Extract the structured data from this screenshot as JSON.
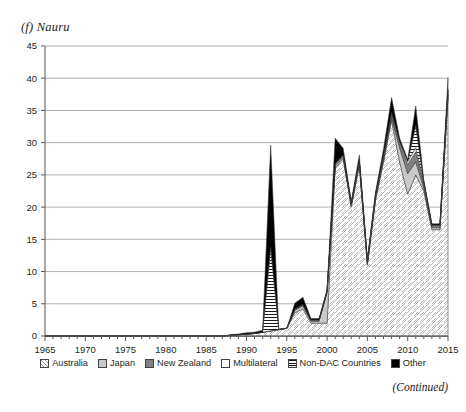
{
  "figure": {
    "panel_title": "(f) Nauru",
    "continued_note": "(Continued)"
  },
  "legend": {
    "position": "bottom",
    "items": [
      {
        "label": "Australia",
        "pattern": "diagonal-hatch",
        "color": "#ffffff",
        "icon": "legend-swatch-australia"
      },
      {
        "label": "Japan",
        "pattern": "solid-light-gray",
        "color": "#c9c9c9",
        "icon": "legend-swatch-japan"
      },
      {
        "label": "New Zealand",
        "pattern": "solid-dark-gray",
        "color": "#808080",
        "icon": "legend-swatch-new-zealand"
      },
      {
        "label": "Multilateral",
        "pattern": "white",
        "color": "#ffffff",
        "icon": "legend-swatch-multilateral"
      },
      {
        "label": "Non-DAC Countries",
        "pattern": "horizontal-lines",
        "color": "#ffffff",
        "icon": "legend-swatch-non-dac-countries"
      },
      {
        "label": "Other",
        "pattern": "solid-black",
        "color": "#000000",
        "icon": "legend-swatch-other"
      }
    ]
  },
  "axes": {
    "y_ticks": [
      "0",
      "5",
      "10",
      "15",
      "20",
      "25",
      "30",
      "35",
      "40",
      "45"
    ],
    "x_ticks": [
      "1965",
      "1970",
      "1975",
      "1980",
      "1985",
      "1990",
      "1995",
      "2000",
      "2005",
      "2010",
      "2015"
    ]
  },
  "chart_data": {
    "type": "area",
    "stacked": true,
    "title": "(f) Nauru",
    "xlabel": "",
    "ylabel": "",
    "xlim": [
      1965,
      2015
    ],
    "ylim": [
      0,
      45
    ],
    "ytick_step": 5,
    "xtick_step": 5,
    "grid": "horizontal",
    "legend_position": "bottom",
    "x": [
      1965,
      1966,
      1967,
      1968,
      1969,
      1970,
      1971,
      1972,
      1973,
      1974,
      1975,
      1976,
      1977,
      1978,
      1979,
      1980,
      1981,
      1982,
      1983,
      1984,
      1985,
      1986,
      1987,
      1988,
      1989,
      1990,
      1991,
      1992,
      1993,
      1994,
      1995,
      1996,
      1997,
      1998,
      1999,
      2000,
      2001,
      2002,
      2003,
      2004,
      2005,
      2006,
      2007,
      2008,
      2009,
      2010,
      2011,
      2012,
      2013,
      2014,
      2015
    ],
    "series": [
      {
        "name": "Australia",
        "values": [
          0,
          0,
          0,
          0,
          0,
          0,
          0,
          0,
          0,
          0,
          0,
          0,
          0,
          0,
          0,
          0,
          0,
          0,
          0,
          0,
          0,
          0,
          0,
          0.1,
          0.2,
          0.3,
          0.4,
          0.6,
          0.8,
          1.0,
          1.2,
          3.6,
          4.2,
          2.0,
          2.0,
          2.0,
          26.0,
          27.5,
          20.0,
          26.5,
          11.0,
          21.0,
          27.0,
          33.5,
          27.0,
          22.0,
          25.0,
          22.5,
          16.5,
          16.5,
          37.0
        ],
        "color": "#ffffff",
        "pattern": "diagonal-hatch"
      },
      {
        "name": "Japan",
        "values": [
          0,
          0,
          0,
          0,
          0,
          0,
          0,
          0,
          0,
          0,
          0,
          0,
          0,
          0,
          0,
          0,
          0,
          0,
          0,
          0,
          0,
          0,
          0,
          0,
          0,
          0,
          0,
          0,
          0,
          0,
          0,
          0.4,
          0.5,
          0.3,
          0.3,
          4.8,
          0.4,
          0.3,
          0.3,
          0.3,
          0.3,
          0.3,
          0.4,
          0.4,
          2.2,
          3.2,
          2.0,
          0.5,
          0.3,
          0.3,
          0.4
        ],
        "color": "#c9c9c9",
        "pattern": "solid-light-gray"
      },
      {
        "name": "New Zealand",
        "values": [
          0,
          0,
          0,
          0,
          0,
          0,
          0,
          0,
          0,
          0,
          0,
          0,
          0,
          0,
          0,
          0,
          0,
          0,
          0,
          0,
          0,
          0,
          0,
          0,
          0,
          0,
          0,
          0,
          0,
          0,
          0,
          0.1,
          0.1,
          0.1,
          0.1,
          0.1,
          0.1,
          0.1,
          0.1,
          0.1,
          0.1,
          0.2,
          0.3,
          0.4,
          0.6,
          1.4,
          1.6,
          0.4,
          0.2,
          0.2,
          0.3
        ],
        "color": "#808080",
        "pattern": "solid-dark-gray"
      },
      {
        "name": "Multilateral",
        "values": [
          0,
          0,
          0,
          0,
          0,
          0,
          0,
          0,
          0,
          0,
          0,
          0,
          0,
          0,
          0,
          0,
          0,
          0,
          0,
          0,
          0,
          0,
          0,
          0,
          0,
          0,
          0,
          0,
          0,
          0,
          0,
          0.1,
          0.1,
          0.1,
          0.1,
          0.1,
          0.2,
          0.2,
          0.2,
          0.2,
          0.2,
          0.3,
          0.3,
          0.4,
          0.4,
          0.5,
          0.6,
          0.4,
          0.2,
          0.2,
          0.4
        ],
        "color": "#ffffff",
        "pattern": "white"
      },
      {
        "name": "Non-DAC Countries",
        "values": [
          0,
          0,
          0,
          0,
          0,
          0,
          0,
          0,
          0,
          0,
          0,
          0,
          0,
          0,
          0,
          0,
          0,
          0,
          0,
          0,
          0,
          0,
          0,
          0,
          0,
          0,
          0,
          0,
          13.0,
          0,
          0,
          0,
          0,
          0,
          0,
          0,
          0,
          0,
          0,
          0,
          0,
          0,
          0,
          0,
          0,
          0,
          3.5,
          0,
          0,
          0,
          0.2
        ],
        "color": "#ffffff",
        "pattern": "horizontal-lines"
      },
      {
        "name": "Other",
        "values": [
          0,
          0,
          0,
          0,
          0,
          0,
          0,
          0,
          0,
          0,
          0,
          0,
          0,
          0,
          0,
          0,
          0,
          0,
          0,
          0,
          0,
          0,
          0,
          0.1,
          0.1,
          0.2,
          0.2,
          0.3,
          15.8,
          0,
          0,
          0.9,
          1.1,
          0.2,
          0.2,
          0.2,
          4.0,
          1.0,
          0.3,
          1.0,
          0.3,
          0.5,
          1.0,
          2.3,
          0.5,
          0.3,
          3.0,
          0.4,
          0.2,
          0.2,
          1.8
        ],
        "color": "#000000",
        "pattern": "solid-black"
      }
    ]
  }
}
